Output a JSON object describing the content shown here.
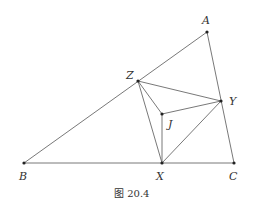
{
  "figure": {
    "caption": "图 20.4",
    "points": {
      "A": {
        "label": "A",
        "x": 207,
        "y": 32
      },
      "Z": {
        "label": "Z",
        "x": 138,
        "y": 81
      },
      "Y": {
        "label": "Y",
        "x": 221,
        "y": 101
      },
      "J": {
        "label": "J",
        "x": 162,
        "y": 114
      },
      "B": {
        "label": "B",
        "x": 24,
        "y": 163
      },
      "X": {
        "label": "X",
        "x": 162,
        "y": 163
      },
      "C": {
        "label": "C",
        "x": 234,
        "y": 163
      }
    },
    "segments": [
      [
        "A",
        "B"
      ],
      [
        "A",
        "C"
      ],
      [
        "B",
        "C"
      ],
      [
        "Z",
        "Y"
      ],
      [
        "Z",
        "X"
      ],
      [
        "X",
        "Y"
      ],
      [
        "J",
        "X"
      ],
      [
        "J",
        "Y"
      ],
      [
        "J",
        "Z"
      ]
    ]
  }
}
